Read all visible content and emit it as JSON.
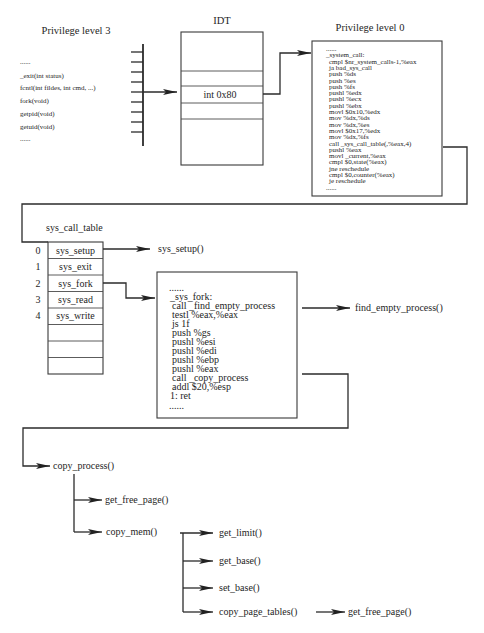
{
  "colors": {
    "line": "#2b2b2b",
    "text": "#1e1e1e",
    "background": "#ffffff"
  },
  "privilege_level_3": {
    "title": "Privilege level 3",
    "calls": [
      "......",
      "_exit(int status)",
      "fcntl(int fildes, int cmd, ...)",
      "fork(void)",
      "getpid(void)",
      "getuid(void)",
      "......"
    ]
  },
  "idt": {
    "title": "IDT",
    "entry": "int 0x80"
  },
  "privilege_level_0": {
    "title": "Privilege level 0",
    "code": [
      "......",
      "_system_call:",
      "cmpl $nr_system_calls-1,%eax",
      "ja bad_sys_call",
      "push %ds",
      "push %es",
      "push %fs",
      "pushl %edx",
      "pushl %ecx",
      "pushl %ebx",
      "movl $0x10,%edx",
      "mov %dx,%ds",
      "mov %dx,%es",
      "movl $0x17,%edx",
      "mov %dx,%fs",
      "call _sys_call_table(,%eax,4)",
      "pushl %eax",
      "movl _current,%eax",
      "cmpl $0,state(%eax)",
      "jne reschedule",
      "cmpl $0,counter(%eax)",
      "je reschedule",
      "......"
    ]
  },
  "sys_call_table": {
    "title": "sys_call_table",
    "rows": [
      {
        "index": "0",
        "name": "sys_setup"
      },
      {
        "index": "1",
        "name": "sys_exit"
      },
      {
        "index": "2",
        "name": "sys_fork"
      },
      {
        "index": "3",
        "name": "sys_read"
      },
      {
        "index": "4",
        "name": "sys_write"
      },
      {
        "index": "",
        "name": ""
      },
      {
        "index": "",
        "name": ""
      },
      {
        "index": "",
        "name": ""
      }
    ]
  },
  "sys_setup_target": "sys_setup()",
  "sys_fork": {
    "code": [
      "......",
      "_sys_fork:",
      "call _find_empty_process",
      "testl %eax,%eax",
      "js 1f",
      "push %gs",
      "pushl %esi",
      "pushl %edi",
      "pushl %ebp",
      "pushl %eax",
      "call _copy_process",
      "addl $20,%esp",
      "1: ret",
      "......"
    ]
  },
  "find_empty_process": "find_empty_process()",
  "copy_process": {
    "label": "copy_process()",
    "children": {
      "get_free_page": "get_free_page()",
      "copy_mem": {
        "label": "copy_mem()",
        "children": {
          "get_limit": "get_limit()",
          "get_base": "get_base()",
          "set_base": "set_base()",
          "copy_page_tables": {
            "label": "copy_page_tables()",
            "callee": "get_free_page()"
          }
        }
      }
    }
  }
}
